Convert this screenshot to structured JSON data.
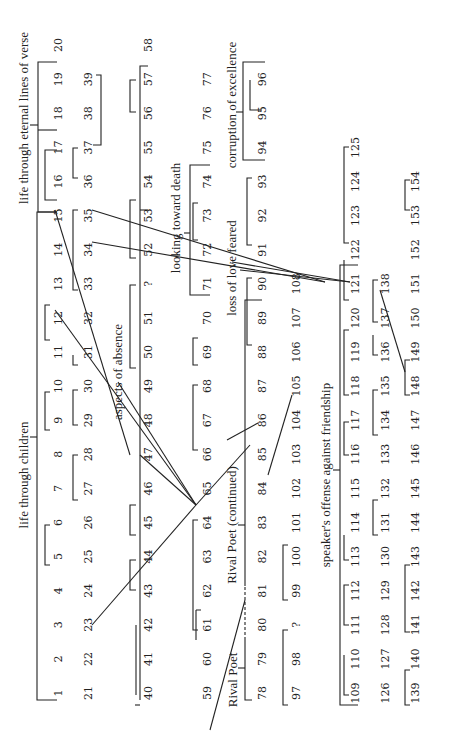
{
  "diagram": {
    "orientation": "rotated -90deg",
    "rows": [
      {
        "x": 58,
        "start_col": 0,
        "numbers": [
          "1",
          "2",
          "3",
          "4",
          "5",
          "6",
          "7",
          "8",
          "9",
          "10",
          "11",
          "12",
          "13",
          "14",
          "15",
          "16",
          "17",
          "18",
          "19",
          "20"
        ]
      },
      {
        "x": 88,
        "start_col": 0,
        "numbers": [
          "21",
          "22",
          "23",
          "24",
          "25",
          "26",
          "27",
          "28",
          "29",
          "30",
          "31",
          "32",
          "33",
          "34",
          "35",
          "36",
          "37",
          "38",
          "39"
        ]
      },
      {
        "x": 148,
        "start_col": 0,
        "numbers": [
          "40",
          "41",
          "42",
          "43",
          "44",
          "45",
          "46",
          "47",
          "48",
          "49",
          "50",
          "51",
          "?",
          "52",
          "53",
          "54",
          "55",
          "56",
          "57",
          "58"
        ]
      },
      {
        "x": 207,
        "start_col": 0,
        "numbers": [
          "59",
          "60",
          "61",
          "62",
          "63",
          "64",
          "65",
          "66",
          "67",
          "68",
          "69",
          "70",
          "71",
          "72",
          "73",
          "74",
          "75",
          "76",
          "77"
        ]
      },
      {
        "x": 262,
        "start_col": 0,
        "numbers": [
          "78",
          "79",
          "80",
          "81",
          "82",
          "83",
          "84",
          "85",
          "86",
          "87",
          "88",
          "89",
          "90",
          "91",
          "92",
          "93",
          "94",
          "95",
          "96"
        ]
      },
      {
        "x": 296,
        "start_col": 0,
        "numbers": [
          "97",
          "98",
          "?",
          "99",
          "100",
          "101",
          "102",
          "103",
          "104",
          "105",
          "106",
          "107",
          "108"
        ]
      },
      {
        "x": 355,
        "start_col": 0,
        "numbers": [
          "109",
          "110",
          "111",
          "112",
          "113",
          "114",
          "115",
          "116",
          "117",
          "118",
          "119",
          "120",
          "121",
          "122",
          "123",
          "124",
          "125"
        ]
      },
      {
        "x": 385,
        "start_col": 0,
        "numbers": [
          "126",
          "127",
          "128",
          "129",
          "130",
          "131",
          "132",
          "133",
          "134",
          "135",
          "136",
          "137",
          "138"
        ]
      },
      {
        "x": 415,
        "start_col": 0,
        "numbers": [
          "139",
          "140",
          "141",
          "142",
          "143",
          "144",
          "145",
          "146",
          "147",
          "148",
          "149",
          "150",
          "151",
          "152",
          "153",
          "154"
        ]
      }
    ],
    "labels": {
      "life_children": "life through children",
      "life_verse": "life through eternal lines of verse",
      "aspects_absence": "aspects of absence",
      "looking_death": "looking toward death",
      "loss_love": "loss of love feared",
      "corruption": "corruption of excellence",
      "rival_poet": "Rival Poet",
      "rival_poet_cont": "Rival Poet (continued)",
      "speaker_offense": "speaker's offense against friendship"
    }
  }
}
